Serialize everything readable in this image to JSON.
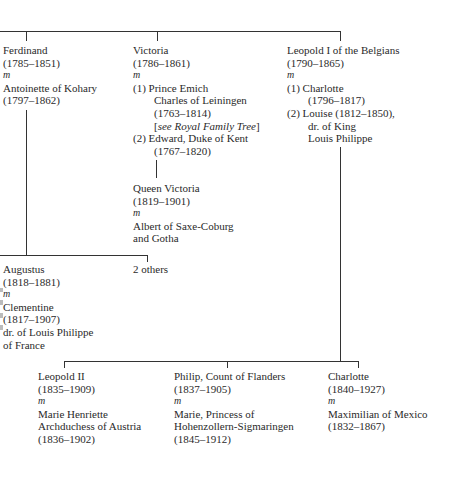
{
  "marriage_marker": "m",
  "generation1": {
    "ferdinand": {
      "name": "Ferdinand",
      "dates": "(1785–1851)",
      "spouse": "Antoinette of Kohary",
      "spouse_dates": "(1797–1862)"
    },
    "victoria": {
      "name": "Victoria",
      "dates": "(1786–1861)",
      "spouse1_label": "(1) Prince Emich",
      "spouse1_line2": "Charles of Leiningen",
      "spouse1_dates": "(1763–1814)",
      "spouse1_note": "[see Royal Family Tree]",
      "spouse1_note_prefix": "[",
      "spouse1_note_text": "see Royal Family Tree",
      "spouse1_note_suffix": "]",
      "spouse2_label": "(2) Edward, Duke of Kent",
      "spouse2_dates": "(1767–1820)"
    },
    "leopold1": {
      "name": "Leopold I of the Belgians",
      "dates": "(1790–1865)",
      "spouse1_label": "(1) Charlotte",
      "spouse1_dates": "(1796–1817)",
      "spouse2_label": "(2) Louise (1812–1850),",
      "spouse2_line2": "dr. of King",
      "spouse2_line3": "Louis Philippe"
    }
  },
  "queen_victoria": {
    "name": "Queen Victoria",
    "dates": "(1819–1901)",
    "spouse": "Albert of Saxe-Coburg",
    "spouse_line2": "and Gotha"
  },
  "generation2_ferdinand": {
    "augustus": {
      "name": "Augustus",
      "dates": "(1818–1881)",
      "spouse": "Clementine",
      "spouse_dates": "(1817–1907)",
      "spouse_line3": "dr. of Louis Philippe",
      "spouse_line4": "of France"
    },
    "others": "2 others"
  },
  "generation2_leopold": {
    "leopold2": {
      "name": "Leopold II",
      "dates": "(1835–1909)",
      "spouse": "Marie Henriette",
      "spouse_line2": "Archduchess of Austria",
      "spouse_dates": "(1836–1902)"
    },
    "philip": {
      "name": "Philip, Count of Flanders",
      "dates": "(1837–1905)",
      "spouse": "Marie, Princess of",
      "spouse_line2": "Hohenzollern-Sigmaringen",
      "spouse_dates": "(1845–1912)"
    },
    "charlotte": {
      "name": "Charlotte",
      "dates": "(1840–1927)",
      "spouse": "Maximilian of Mexico",
      "spouse_dates": "(1832–1867)"
    }
  }
}
